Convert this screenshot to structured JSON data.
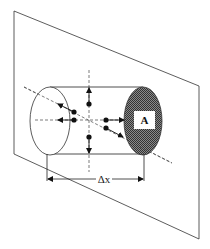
{
  "diagram": {
    "type": "control-volume-cylinder",
    "labels": {
      "area": "A",
      "length": "Δx"
    },
    "colors": {
      "line": "#222222",
      "shaded_face": "#555555",
      "background": "#ffffff"
    },
    "elements": {
      "plane": "parallelogram plane",
      "cylinder": "cylinder with shaded end face A",
      "axes": [
        "vertical dashed axis",
        "horizontal dashed axis",
        "diagonal dashed axis"
      ],
      "flux_arrows": 6
    }
  }
}
